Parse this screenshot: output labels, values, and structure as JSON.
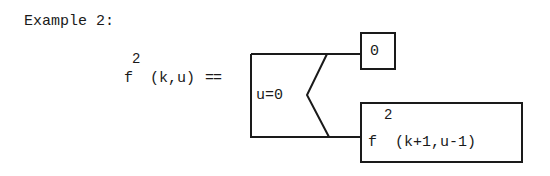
{
  "heading": "Example 2:",
  "definition": {
    "lhs_func": "f",
    "lhs_sup": "2",
    "lhs_args": "(k,u)",
    "operator": "=="
  },
  "condition": {
    "label": "u=0"
  },
  "branches": [
    {
      "name": "true",
      "value": "0"
    },
    {
      "name": "false",
      "func": "f",
      "sup": "2",
      "args": "(k+1,u-1)"
    }
  ],
  "colors": {
    "ink": "#1a1a1a",
    "background": "#ffffff"
  }
}
